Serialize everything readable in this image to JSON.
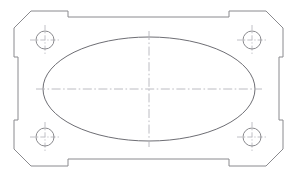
{
  "drawing": {
    "title": "Gasket Plate Outline Drawing",
    "view_name": "top-view",
    "projection": "orthographic",
    "units": "pixels",
    "canvas": {
      "width": 297,
      "height": 176
    },
    "background_color": "#ffffff",
    "colors": {
      "outline_stroke": "#8a8a8e",
      "cutout_stroke": "#6e6e74",
      "bore_stroke": "#8a8a8e",
      "centerline_stroke": "#b4b4bb"
    },
    "line_styles": {
      "visible_edge": "solid",
      "center_axis": "dash-dot"
    }
  },
  "plate": {
    "name": "flange-plate",
    "description": "Rectangular plate with chamfered corners, stepped side notches and four corner bores",
    "bounds": {
      "left": 14,
      "top": 11,
      "right": 283,
      "bottom": 166
    },
    "chamfer_size": 17,
    "outline_points": "M 31,11 L 68,11 L 68,17 L 229,17 L 229,11 L 266,11 L 283,28 L 283,57 L 279,57 L 279,120 L 283,120 L 283,149 L 266,166 L 229,166 L 229,159 L 68,159 L 68,166 L 31,166 L 14,149 L 14,120 L 18,120 L 18,57 L 14,57 L 14,28 Z",
    "notches": [
      {
        "name": "top-notch",
        "edge": "top",
        "x_start": 68,
        "x_end": 229,
        "depth": 6
      },
      {
        "name": "bottom-notch",
        "edge": "bottom",
        "x_start": 68,
        "x_end": 229,
        "depth": 7
      },
      {
        "name": "left-notch",
        "edge": "left",
        "y_start": 57,
        "y_end": 120,
        "depth": 4
      },
      {
        "name": "right-notch",
        "edge": "right",
        "y_start": 57,
        "y_end": 120,
        "depth": 4
      }
    ]
  },
  "cutout": {
    "name": "central-elliptical-cutout",
    "shape": "ellipse",
    "center": {
      "x": 149,
      "y": 89
    },
    "radius_x": 106,
    "radius_y": 52,
    "extents": {
      "left": 43,
      "right": 255,
      "top": 37,
      "bottom": 141
    }
  },
  "bores": [
    {
      "name": "bore-top-left",
      "position": "top-left",
      "cx": 45,
      "cy": 40,
      "r": 9
    },
    {
      "name": "bore-top-right",
      "position": "top-right",
      "cx": 252,
      "cy": 40,
      "r": 9
    },
    {
      "name": "bore-bottom-left",
      "position": "bottom-left",
      "cx": 45,
      "cy": 137,
      "r": 9
    },
    {
      "name": "bore-bottom-right",
      "position": "bottom-right",
      "cx": 252,
      "cy": 137,
      "r": 9
    }
  ],
  "centerlines": {
    "main_horizontal": {
      "name": "main-horizontal-axis",
      "x1": 36,
      "y1": 89,
      "x2": 262,
      "y2": 89
    },
    "main_vertical": {
      "name": "main-vertical-axis",
      "x1": 149,
      "y1": 31,
      "x2": 149,
      "y2": 147
    },
    "bore_axes": [
      {
        "name": "bore-top-left-h",
        "x1": 30,
        "y1": 40,
        "x2": 60,
        "y2": 40
      },
      {
        "name": "bore-top-left-v",
        "x1": 45,
        "y1": 25,
        "x2": 45,
        "y2": 55
      },
      {
        "name": "bore-top-right-h",
        "x1": 237,
        "y1": 40,
        "x2": 267,
        "y2": 40
      },
      {
        "name": "bore-top-right-v",
        "x1": 252,
        "y1": 25,
        "x2": 252,
        "y2": 55
      },
      {
        "name": "bore-bottom-left-h",
        "x1": 30,
        "y1": 137,
        "x2": 60,
        "y2": 137
      },
      {
        "name": "bore-bottom-left-v",
        "x1": 45,
        "y1": 122,
        "x2": 45,
        "y2": 152
      },
      {
        "name": "bore-bottom-right-h",
        "x1": 237,
        "y1": 137,
        "x2": 267,
        "y2": 137
      },
      {
        "name": "bore-bottom-right-v",
        "x1": 252,
        "y1": 122,
        "x2": 252,
        "y2": 152
      }
    ]
  }
}
